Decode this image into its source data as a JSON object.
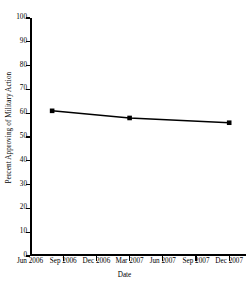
{
  "chart_data": {
    "type": "line",
    "title": "",
    "xlabel": "Date",
    "ylabel": "Percent Approving of Military Action",
    "ylim": [
      0,
      100
    ],
    "yticks": [
      0,
      10,
      20,
      30,
      40,
      50,
      60,
      70,
      80,
      90,
      100
    ],
    "ytick_labels": [
      "0",
      "10",
      "20",
      "30",
      "40",
      "50",
      "60",
      "70",
      "80",
      "90",
      "100"
    ],
    "xtick_labels": [
      "Jun 2006",
      "Sep 2006",
      "Dec 2006",
      "Mar 2007",
      "Jun 2007",
      "Sep 2007",
      "Dec 2007"
    ],
    "x_categories": [
      "Jun 2006",
      "Sep 2006",
      "Dec 2006",
      "Mar 2007",
      "Jun 2007",
      "Sep 2007",
      "Dec 2007"
    ],
    "grid": false,
    "legend": false,
    "legend_position": "none",
    "marker": "square",
    "line_color": "#000000",
    "marker_color": "#000000",
    "background_color": "#ffffff",
    "axis_color": "#000000",
    "series": [
      {
        "name": "Percent Approving of Military Action",
        "points": [
          {
            "x_label": "Aug 2006",
            "x_value": 2.0,
            "y": 61
          },
          {
            "x_label": "Mar 2007",
            "x_value": 9.0,
            "y": 58
          },
          {
            "x_label": "Dec 2007",
            "x_value": 18.0,
            "y": 56
          }
        ],
        "values": [
          61,
          58,
          56
        ]
      }
    ]
  }
}
